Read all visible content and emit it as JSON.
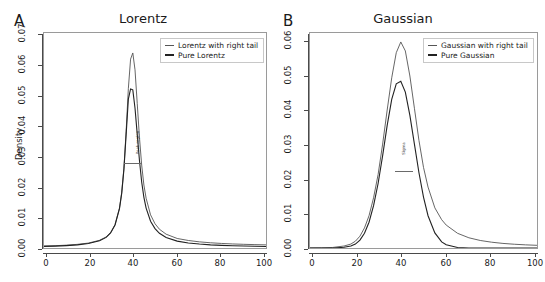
{
  "figure": {
    "width": 545,
    "height": 282,
    "background": "#ffffff"
  },
  "panels": [
    {
      "letter": "A",
      "title": "Lorentz",
      "ylabel": "Density",
      "xticks": [
        "0",
        "20",
        "40",
        "60",
        "80",
        "100"
      ],
      "yticks": [
        "0.00",
        "0.01",
        "0.02",
        "0.03",
        "0.04",
        "0.05",
        "0.06",
        "0.07"
      ],
      "legend": [
        {
          "label": "Lorentz with right tail",
          "color": "#555555",
          "weight": "thin"
        },
        {
          "label": "Pure Lorentz",
          "color": "#222222",
          "weight": "thick"
        }
      ],
      "annotation": "Peak region"
    },
    {
      "letter": "B",
      "title": "Gaussian",
      "ylabel": "",
      "xticks": [
        "0",
        "20",
        "40",
        "60",
        "80",
        "100"
      ],
      "yticks": [
        "0.00",
        "0.01",
        "0.02",
        "0.03",
        "0.04",
        "0.05",
        "0.06"
      ],
      "legend": [
        {
          "label": "Gaussian with right tail",
          "color": "#555555",
          "weight": "thin"
        },
        {
          "label": "Pure Gaussian",
          "color": "#222222",
          "weight": "thick"
        }
      ],
      "annotation": "Sigma"
    }
  ],
  "chart_data": [
    {
      "type": "line",
      "title": "Lorentz",
      "panel": "A",
      "xlabel": "",
      "ylabel": "Density",
      "xlim": [
        0,
        100
      ],
      "ylim": [
        0.0,
        0.07
      ],
      "grid": false,
      "legend_position": "top-right",
      "x": [
        0,
        5,
        10,
        15,
        20,
        25,
        28,
        30,
        32,
        34,
        35,
        36,
        37,
        38,
        39,
        40,
        41,
        42,
        43,
        44,
        45,
        46,
        48,
        50,
        52,
        55,
        60,
        65,
        70,
        75,
        80,
        85,
        90,
        95,
        100
      ],
      "series": [
        {
          "name": "Lorentz with right tail",
          "color": "#555555",
          "values": [
            0.00065,
            0.00075,
            0.00092,
            0.00118,
            0.0016,
            0.0025,
            0.0036,
            0.005,
            0.0076,
            0.013,
            0.018,
            0.026,
            0.038,
            0.052,
            0.0615,
            0.0635,
            0.058,
            0.047,
            0.036,
            0.027,
            0.0205,
            0.0162,
            0.0108,
            0.0079,
            0.0061,
            0.0045,
            0.0031,
            0.00245,
            0.002,
            0.0017,
            0.00148,
            0.00132,
            0.0012,
            0.0011,
            0.00102
          ]
        },
        {
          "name": "Pure Lorentz",
          "color": "#222222",
          "values": [
            0.00052,
            0.00062,
            0.00078,
            0.00102,
            0.00145,
            0.00235,
            0.00345,
            0.0049,
            0.0075,
            0.0128,
            0.0178,
            0.0256,
            0.037,
            0.0485,
            0.0518,
            0.0515,
            0.0455,
            0.037,
            0.0285,
            0.0215,
            0.0165,
            0.013,
            0.0087,
            0.0063,
            0.0048,
            0.00345,
            0.00225,
            0.00165,
            0.00128,
            0.00103,
            0.00086,
            0.00074,
            0.00064,
            0.00057,
            0.00051
          ]
        }
      ]
    },
    {
      "type": "line",
      "title": "Gaussian",
      "panel": "B",
      "xlabel": "",
      "ylabel": "",
      "xlim": [
        0,
        100
      ],
      "ylim": [
        0.0,
        0.06
      ],
      "grid": false,
      "legend_position": "top-right",
      "x": [
        0,
        5,
        10,
        15,
        18,
        20,
        22,
        24,
        26,
        28,
        30,
        32,
        34,
        36,
        38,
        40,
        42,
        44,
        46,
        48,
        50,
        52,
        55,
        58,
        60,
        65,
        70,
        75,
        80,
        85,
        90,
        95,
        100
      ],
      "series": [
        {
          "name": "Gaussian with right tail",
          "color": "#555555",
          "values": [
            2e-05,
            5e-05,
            0.00015,
            0.00055,
            0.0011,
            0.0019,
            0.0033,
            0.0056,
            0.009,
            0.014,
            0.0205,
            0.029,
            0.0385,
            0.0475,
            0.0545,
            0.0575,
            0.055,
            0.048,
            0.039,
            0.03,
            0.0225,
            0.017,
            0.0112,
            0.0079,
            0.0064,
            0.0041,
            0.00285,
            0.0021,
            0.00162,
            0.00128,
            0.00105,
            0.00088,
            0.00075
          ]
        },
        {
          "name": "Pure Gaussian",
          "color": "#222222",
          "values": [
            0.0,
            0.0,
            2e-05,
            0.0002,
            0.00055,
            0.0011,
            0.0022,
            0.0041,
            0.0072,
            0.0118,
            0.018,
            0.0258,
            0.0342,
            0.0415,
            0.0458,
            0.0465,
            0.0435,
            0.037,
            0.029,
            0.021,
            0.0142,
            0.009,
            0.0042,
            0.0017,
            0.0009,
            0.00015,
            2e-05,
            0.0,
            0.0,
            0.0,
            0.0,
            0.0,
            0.0
          ]
        }
      ]
    }
  ]
}
